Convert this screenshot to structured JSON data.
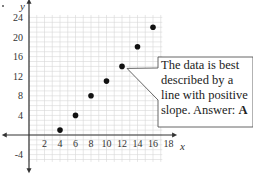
{
  "chart_data": {
    "type": "scatter",
    "title": "",
    "xlabel": "x",
    "ylabel": "y",
    "x_ticks": [
      2,
      4,
      6,
      8,
      10,
      12,
      14,
      16,
      18
    ],
    "y_ticks": [
      24,
      20,
      16,
      12,
      8,
      4,
      -4
    ],
    "xlim": [
      -3,
      18
    ],
    "ylim": [
      -7,
      25
    ],
    "grid": true,
    "series": [
      {
        "name": "data",
        "points": [
          {
            "x": 4,
            "y": 1
          },
          {
            "x": 6,
            "y": 4
          },
          {
            "x": 8,
            "y": 8
          },
          {
            "x": 10,
            "y": 11
          },
          {
            "x": 12,
            "y": 14
          },
          {
            "x": 14,
            "y": 18
          },
          {
            "x": 16,
            "y": 22
          }
        ]
      }
    ],
    "annotation": {
      "text": "The data is best described by a line with positive slope.",
      "answer_label": "Answer:",
      "answer": "A",
      "points_to": {
        "x": 12,
        "y": 14
      }
    }
  },
  "labels": {
    "x_axis": "x",
    "y_axis": "y",
    "callout_line1": "The data is best",
    "callout_line2": "described by a",
    "callout_line3": "line with positive",
    "callout_line4_prefix": "slope.  Answer:",
    "callout_answer": "A"
  }
}
